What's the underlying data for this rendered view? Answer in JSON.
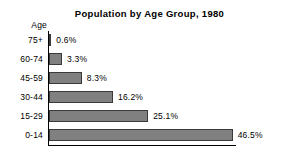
{
  "chart_data": {
    "type": "bar",
    "orientation": "horizontal",
    "title": "Population by Age Group, 1980",
    "xlabel": "",
    "ylabel": "Age",
    "categories": [
      "75+",
      "60-74",
      "45-59",
      "30-44",
      "15-29",
      "0-14"
    ],
    "values": [
      0.6,
      3.3,
      8.3,
      16.2,
      25.1,
      46.5
    ],
    "value_labels": [
      "0.6%",
      "3.3%",
      "8.3%",
      "16.2%",
      "25.1%",
      "46.5%"
    ],
    "xlim": [
      0,
      46.5
    ],
    "grid": false,
    "legend": null,
    "bar_color": "#808080",
    "bar_border_color": "#3a3a3a",
    "axis_color": "#000000",
    "background_color": "#ffffff",
    "units": "percent"
  },
  "chart": {
    "title": "Population by Age Group, 1980",
    "axis_caption": "Age",
    "rows": [
      {
        "category": "75+",
        "value": 0.6,
        "label": "0.6%"
      },
      {
        "category": "60-74",
        "value": 3.3,
        "label": "3.3%"
      },
      {
        "category": "45-59",
        "value": 8.3,
        "label": "8.3%"
      },
      {
        "category": "30-44",
        "value": 16.2,
        "label": "16.2%"
      },
      {
        "category": "15-29",
        "value": 25.1,
        "label": "25.1%"
      },
      {
        "category": "0-14",
        "value": 46.5,
        "label": "46.5%"
      }
    ]
  }
}
